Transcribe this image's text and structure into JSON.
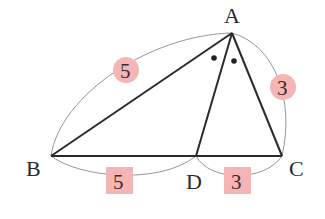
{
  "diagram": {
    "type": "geometry-triangle-angle-bisector",
    "colors": {
      "edge": "#2a2a2a",
      "arc": "#888888",
      "badge_fill": "#f5b5b5",
      "text": "#2a2a2a"
    },
    "vertices": [
      {
        "id": "A",
        "label": "A",
        "x": 232,
        "y": 33
      },
      {
        "id": "B",
        "label": "B",
        "x": 51,
        "y": 156
      },
      {
        "id": "C",
        "label": "C",
        "x": 282,
        "y": 156
      },
      {
        "id": "D",
        "label": "D",
        "x": 196,
        "y": 156
      }
    ],
    "segments": [
      {
        "from": "A",
        "to": "B"
      },
      {
        "from": "A",
        "to": "C"
      },
      {
        "from": "B",
        "to": "C"
      },
      {
        "from": "A",
        "to": "D"
      }
    ],
    "angle_marks": {
      "vertex": "A",
      "marks": [
        "dot",
        "dot"
      ],
      "meaning": "angle BAD = angle DAC"
    },
    "lengths": [
      {
        "segment": "AB",
        "value": "5",
        "shape": "circle"
      },
      {
        "segment": "AC",
        "value": "3",
        "shape": "circle"
      },
      {
        "segment": "BD",
        "value": "5",
        "shape": "square"
      },
      {
        "segment": "DC",
        "value": "3",
        "shape": "square"
      }
    ]
  }
}
